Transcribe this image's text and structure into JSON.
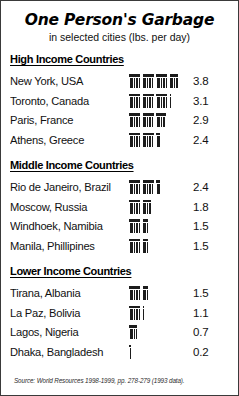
{
  "title": "One Person's Garbage",
  "subtitle": "in selected cities (lbs. per day)",
  "source": "Source: World Resources 1998-1999, pp. 278-279 (1993 data).",
  "icon_unit_label": "trash-can",
  "colors": {
    "ink": "#111111",
    "icon": "#1c1c1c",
    "border": "#3a3a3a",
    "background": "#ffffff"
  },
  "chart_data": {
    "type": "bar",
    "title": "One Person's Garbage",
    "subtitle": "in selected cities (lbs. per day)",
    "xlabel": "",
    "ylabel": "lbs. per day",
    "units": "lbs. per day",
    "pictogram_unit": 1.0,
    "grid": false,
    "legend": false,
    "source": "Source: World Resources 1998-1999, pp. 278-279 (1993 data).",
    "groups": [
      {
        "name": "High Income Countries",
        "categories": [
          "New York, USA",
          "Toronto, Canada",
          "Paris, France",
          "Athens, Greece"
        ],
        "values": [
          3.8,
          3.1,
          2.9,
          2.4
        ]
      },
      {
        "name": "Middle Income Countries",
        "categories": [
          "Rio de Janeiro, Brazil",
          "Moscow, Russia",
          "Windhoek, Namibia",
          "Manila, Phillipines"
        ],
        "values": [
          2.4,
          1.8,
          1.5,
          1.5
        ]
      },
      {
        "name": "Lower Income Countries",
        "categories": [
          "Tirana, Albania",
          "La Paz, Bolivia",
          "Lagos, Nigeria",
          "Dhaka, Bangladesh"
        ],
        "values": [
          1.5,
          1.1,
          0.7,
          0.2
        ]
      }
    ]
  }
}
